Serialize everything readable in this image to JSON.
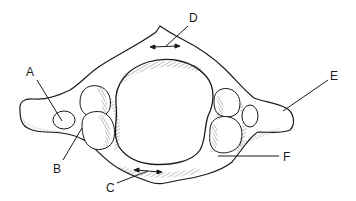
{
  "figure": {
    "stroke_color": "#1a1a1a",
    "background": "#ffffff"
  },
  "labels": [
    {
      "id": "A",
      "text": "A",
      "x": 26,
      "y": 66,
      "line": [
        37,
        80,
        62,
        121
      ]
    },
    {
      "id": "B",
      "text": "B",
      "x": 53,
      "y": 163,
      "line": [
        63,
        160,
        82,
        128
      ]
    },
    {
      "id": "C",
      "text": "C",
      "x": 106,
      "y": 182,
      "line": [
        117,
        183,
        148,
        171
      ]
    },
    {
      "id": "D",
      "text": "D",
      "x": 189,
      "y": 12,
      "line": [
        188,
        26,
        165,
        47
      ]
    },
    {
      "id": "E",
      "text": "E",
      "x": 330,
      "y": 70,
      "line": [
        328,
        80,
        283,
        111
      ]
    },
    {
      "id": "F",
      "text": "F",
      "x": 283,
      "y": 151,
      "line": [
        279,
        156,
        218,
        156
      ]
    }
  ]
}
